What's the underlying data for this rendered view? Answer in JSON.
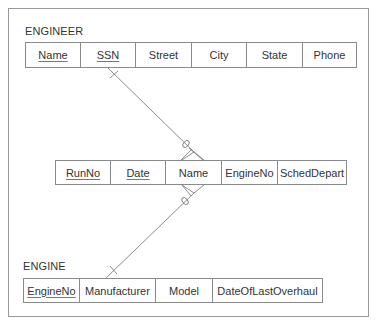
{
  "diagram": {
    "type": "entity-relationship",
    "entities": [
      {
        "name": "ENGINEER",
        "attributes": [
          {
            "label": "Name",
            "key": true
          },
          {
            "label": "SSN",
            "key": true
          },
          {
            "label": "Street",
            "key": false
          },
          {
            "label": "City",
            "key": false
          },
          {
            "label": "State",
            "key": false
          },
          {
            "label": "Phone",
            "key": false
          }
        ]
      },
      {
        "name": "",
        "attributes": [
          {
            "label": "RunNo",
            "key": true
          },
          {
            "label": "Date",
            "key": true
          },
          {
            "label": "Name",
            "key": false
          },
          {
            "label": "EngineNo",
            "key": false
          },
          {
            "label": "SchedDepart",
            "key": false
          }
        ]
      },
      {
        "name": "ENGINE",
        "attributes": [
          {
            "label": "EngineNo",
            "key": true
          },
          {
            "label": "Manufacturer",
            "key": false
          },
          {
            "label": "Model",
            "key": false
          },
          {
            "label": "DateOfLastOverhaul",
            "key": false
          }
        ]
      }
    ],
    "relationships": [
      {
        "from": "ENGINEER.SSN",
        "to": "RUN.Name",
        "from_cardinality": "one",
        "to_cardinality": "zero-or-many"
      },
      {
        "from": "RUN.Name",
        "to": "ENGINE.Manufacturer",
        "from_cardinality": "zero-or-many",
        "to_cardinality": "one"
      }
    ]
  },
  "engineer": {
    "title": "ENGINEER",
    "cols": [
      "Name",
      "SSN",
      "Street",
      "City",
      "State",
      "Phone"
    ]
  },
  "run": {
    "cols": [
      "RunNo",
      "Date",
      "Name",
      "EngineNo",
      "SchedDepart"
    ]
  },
  "engine": {
    "title": "ENGINE",
    "cols": [
      "EngineNo",
      "Manufacturer",
      "Model",
      "DateOfLastOverhaul"
    ]
  },
  "colors": {
    "line": "#6e6e6e",
    "border": "#8a8a8a",
    "frame": "#9a9a9a",
    "text": "#333333"
  }
}
